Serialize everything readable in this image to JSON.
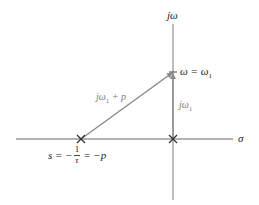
{
  "diagram": {
    "type": "s-plane pole vector diagram",
    "axes": {
      "horizontal_label": "σ",
      "vertical_label": "jω"
    },
    "points": {
      "origin_marker": "×",
      "pole_marker": "×",
      "omega_point_label": "ω = ω",
      "omega_point_sub": "1"
    },
    "pole_label": {
      "prefix": "s = −",
      "frac_num": "1",
      "frac_den": "τ",
      "suffix": "= −p"
    },
    "vectors": {
      "slanted": {
        "label_main": "jω",
        "label_sub": "1",
        "label_tail": " + p"
      },
      "vertical": {
        "label_main": "jω",
        "label_sub": "1"
      }
    },
    "colors": {
      "axis": "#8a8a8a",
      "vector": "#8a8a8a",
      "marker": "#333333",
      "text_black": "#222222",
      "text_gray": "#7a7a7a"
    }
  }
}
